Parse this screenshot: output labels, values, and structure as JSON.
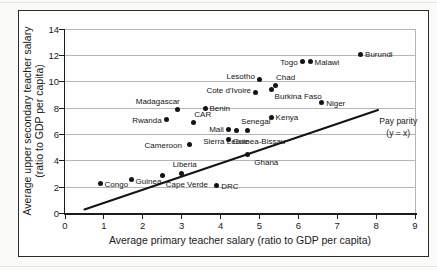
{
  "figure": {
    "background": "#fefefe",
    "border_color": "#2a2a2a",
    "grid_color": "#b5b5b5",
    "axis_color": "#1c1c1c",
    "dot_color": "#141414"
  },
  "chart_data": {
    "type": "scatter",
    "xlabel": "Average primary teacher salary (ratio to GDP per capita)",
    "ylabel_line1": "Average upper secondary teacher salary",
    "ylabel_line2": "(ratio to GDP per capita)",
    "xlim": [
      0,
      9
    ],
    "ylim": [
      0,
      14
    ],
    "x_ticks": [
      0,
      1,
      2,
      3,
      4,
      5,
      6,
      7,
      8,
      9
    ],
    "y_ticks": [
      0,
      2,
      4,
      6,
      8,
      10,
      12,
      14
    ],
    "grid": "horizontal",
    "legend_position": "none",
    "points": [
      {
        "name": "Burundi",
        "x": 7.6,
        "y": 12.1,
        "label_pos": "r"
      },
      {
        "name": "Togo",
        "x": 6.1,
        "y": 11.5,
        "label_pos": "l"
      },
      {
        "name": "Malawi",
        "x": 6.3,
        "y": 11.5,
        "label_pos": "r"
      },
      {
        "name": "Lesotho",
        "x": 5.0,
        "y": 10.2,
        "label_pos": "l",
        "dy": -3
      },
      {
        "name": "Chad",
        "x": 5.4,
        "y": 9.7,
        "label_pos": "ar"
      },
      {
        "name": "Burkina Faso",
        "x": 5.3,
        "y": 9.4,
        "label_pos": "br"
      },
      {
        "name": "Cote d'Ivoire",
        "x": 4.9,
        "y": 9.2,
        "label_pos": "l",
        "dy": -2
      },
      {
        "name": "Niger",
        "x": 6.6,
        "y": 8.4,
        "label_pos": "r"
      },
      {
        "name": "Benin",
        "x": 3.6,
        "y": 8.0,
        "label_pos": "r"
      },
      {
        "name": "Madagascar",
        "x": 2.9,
        "y": 7.9,
        "label_pos": "al"
      },
      {
        "name": "Kenya",
        "x": 5.3,
        "y": 7.3,
        "label_pos": "r"
      },
      {
        "name": "Rwanda",
        "x": 2.6,
        "y": 7.1,
        "label_pos": "l"
      },
      {
        "name": "CAR",
        "x": 3.3,
        "y": 6.9,
        "label_pos": "ar"
      },
      {
        "name": "Mali",
        "x": 4.2,
        "y": 6.4,
        "label_pos": "l"
      },
      {
        "name": "Sierra Leone",
        "x": 4.4,
        "y": 6.3,
        "label_pos": "b",
        "dx": -10,
        "dy": 3
      },
      {
        "name": "Senegal",
        "x": 4.7,
        "y": 6.3,
        "label_pos": "a",
        "dx": 8
      },
      {
        "name": "Guinea-Bissau",
        "x": 4.2,
        "y": 5.6,
        "label_pos": "r",
        "dy": 1
      },
      {
        "name": "Cameroon",
        "x": 3.2,
        "y": 5.2,
        "label_pos": "l",
        "dx": -3
      },
      {
        "name": "Ghana",
        "x": 4.7,
        "y": 4.5,
        "label_pos": "br",
        "dx": 3,
        "dy": 1
      },
      {
        "name": "Liberia",
        "x": 3.0,
        "y": 3.0,
        "label_pos": "a",
        "dx": 3,
        "dy": -1
      },
      {
        "name": "Cape Verde",
        "x": 2.5,
        "y": 2.9,
        "label_pos": "br",
        "dy": 2
      },
      {
        "name": "Guinea",
        "x": 1.7,
        "y": 2.6,
        "label_pos": "r",
        "dy": 2
      },
      {
        "name": "Congo",
        "x": 0.9,
        "y": 2.3,
        "label_pos": "r",
        "dy": 1
      },
      {
        "name": "DRC",
        "x": 3.9,
        "y": 2.1,
        "label_pos": "r"
      }
    ],
    "reference_line": {
      "x1": 0.5,
      "y1": 0.3,
      "x2": 8.05,
      "y2": 7.85,
      "label_line1": "Pay parity",
      "label_line2": "(y = x)",
      "label_anchor": {
        "x": 8.57,
        "y": 6.6
      }
    }
  }
}
